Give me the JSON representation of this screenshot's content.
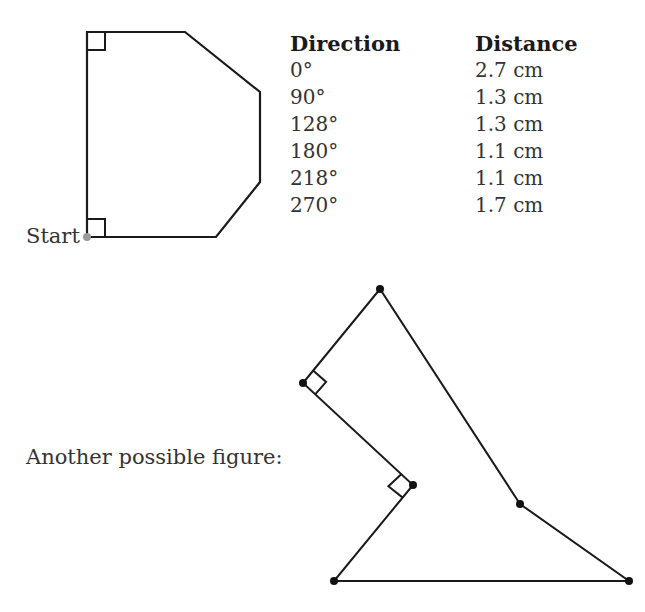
{
  "figure1": {
    "start_label": "Start",
    "vertices": [
      [
        87,
        237
      ],
      [
        87,
        32
      ],
      [
        185,
        32
      ],
      [
        260,
        92
      ],
      [
        260,
        182
      ],
      [
        216,
        237
      ]
    ],
    "right_angle_marks": [
      "top-left",
      "bottom-left"
    ]
  },
  "table": {
    "headers": {
      "direction": "Direction",
      "distance": "Distance"
    },
    "rows": [
      {
        "direction": "0°",
        "distance": "2.7 cm"
      },
      {
        "direction": "90°",
        "distance": "1.3 cm"
      },
      {
        "direction": "128°",
        "distance": "1.3 cm"
      },
      {
        "direction": "180°",
        "distance": "1.1 cm"
      },
      {
        "direction": "218°",
        "distance": "1.1 cm"
      },
      {
        "direction": "270°",
        "distance": "1.7 cm"
      }
    ]
  },
  "figure2": {
    "caption": "Another possible figure:",
    "vertices": [
      [
        334,
        581
      ],
      [
        629,
        581
      ],
      [
        520,
        504
      ],
      [
        380,
        289
      ],
      [
        303,
        383
      ],
      [
        413,
        485
      ]
    ],
    "right_angle_marks": [
      "at (303,383)",
      "at (413,485)"
    ]
  }
}
